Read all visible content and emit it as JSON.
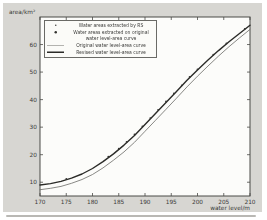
{
  "figure": {
    "background": "#d7d6d2",
    "plot_background": "#fcfcfa",
    "axis_color": "#4a4a46",
    "text_color": "#3a3a38"
  },
  "chart_data": {
    "type": "line",
    "title": "",
    "xlabel": "water level/m",
    "ylabel": "area/km²",
    "xlim": [
      170,
      210
    ],
    "ylim": [
      5,
      70
    ],
    "grid": false,
    "x_ticks": [
      170,
      175,
      180,
      185,
      190,
      195,
      200,
      205,
      210
    ],
    "y_ticks": [
      10,
      20,
      30,
      40,
      50,
      60
    ],
    "x": [
      170,
      172,
      174,
      176,
      178,
      180,
      182,
      184,
      186,
      188,
      190,
      192,
      194,
      196,
      198,
      200,
      202,
      204,
      206,
      208,
      210
    ],
    "series": [
      {
        "name": "Original water level-area curve",
        "style": "thin",
        "color": "#6b6b67",
        "width": 0.8,
        "values": [
          7.3,
          7.8,
          8.5,
          9.6,
          11.0,
          12.8,
          15.2,
          18.0,
          21.0,
          24.5,
          28.5,
          32.5,
          36.5,
          40.5,
          44.6,
          48.5,
          52.2,
          55.8,
          59.2,
          62.4,
          65.5
        ]
      },
      {
        "name": "Revised water level-area curve",
        "style": "thick",
        "color": "#2b2b28",
        "width": 1.4,
        "values": [
          9.0,
          9.5,
          10.3,
          11.5,
          13.0,
          15.0,
          17.5,
          20.3,
          23.5,
          27.0,
          31.0,
          35.0,
          39.0,
          43.0,
          47.0,
          50.8,
          54.4,
          57.8,
          61.0,
          64.0,
          67.0
        ]
      }
    ],
    "scatter": {
      "name": "Water areas extracted (data points)",
      "color": "#333330",
      "points": [
        [
          175,
          11.2
        ],
        [
          183,
          19.3
        ],
        [
          185,
          22.2
        ],
        [
          186.5,
          24.6
        ],
        [
          188,
          27.4
        ],
        [
          189.5,
          30.3
        ],
        [
          191,
          33.3
        ],
        [
          192.5,
          36.3
        ],
        [
          194,
          39.3
        ],
        [
          195.5,
          42.3
        ],
        [
          197,
          45.2
        ],
        [
          198.5,
          48.2
        ],
        [
          200,
          51.0
        ],
        [
          203,
          56.3
        ],
        [
          205.5,
          60.4
        ],
        [
          209,
          65.7
        ]
      ]
    },
    "legend": {
      "position": "top-left",
      "entries": [
        {
          "marker": "dot-small",
          "label": "Water areas extracted by RS"
        },
        {
          "marker": "dot",
          "label": "Water areas extracted on original"
        },
        {
          "marker": "none",
          "label": "water level-area curve"
        },
        {
          "marker": "line-thin",
          "label": "Original water level-area curve"
        },
        {
          "marker": "line-thick",
          "label": "Revised water level-area curve"
        }
      ]
    }
  }
}
